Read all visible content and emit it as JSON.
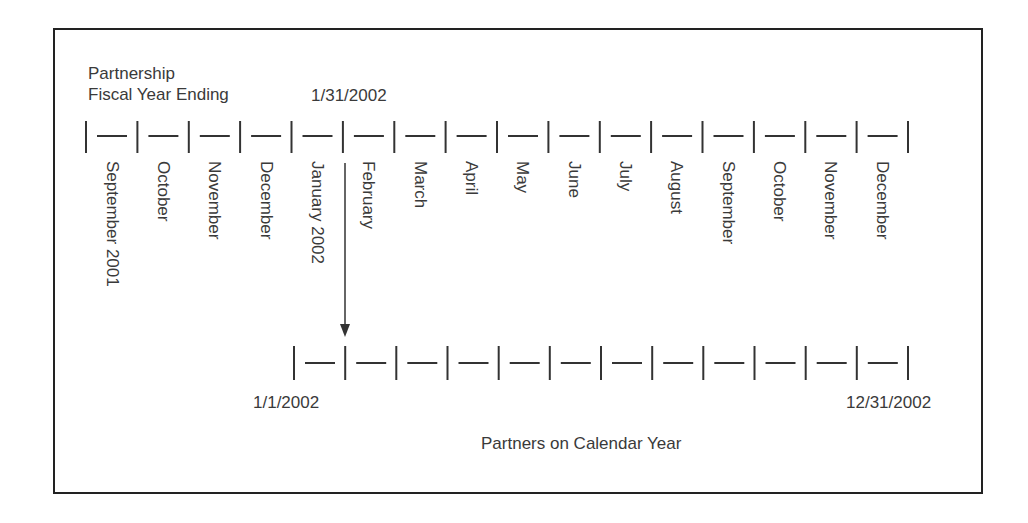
{
  "diagram": {
    "top_timeline": {
      "title_line1": "Partnership",
      "title_line2": "Fiscal Year Ending",
      "fiscal_year_end_label": "1/31/2002",
      "months": [
        "September 2001",
        "October",
        "November",
        "December",
        "January 2002",
        "February",
        "March",
        "April",
        "May",
        "June",
        "July",
        "August",
        "September",
        "October",
        "November",
        "December"
      ]
    },
    "bottom_timeline": {
      "start_label": "1/1/2002",
      "end_label": "12/31/2002",
      "caption": "Partners on Calendar Year",
      "interval_count": 12
    },
    "arrow": {
      "from": "1/31/2002 fiscal year end",
      "to": "partners calendar year timeline"
    },
    "colors": {
      "line": "#333333",
      "text": "#3a3a3a",
      "frame": "#222222"
    }
  }
}
